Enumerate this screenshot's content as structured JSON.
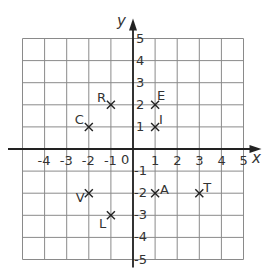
{
  "chart_data": {
    "type": "scatter",
    "title": "",
    "xlabel": "x",
    "ylabel": "y",
    "xlim": [
      -5,
      5
    ],
    "ylim": [
      -5,
      5
    ],
    "grid": true,
    "x_ticks": [
      "-4",
      "-3",
      "-2",
      "-1",
      "0",
      "1",
      "2",
      "3",
      "4",
      "5"
    ],
    "y_ticks": [
      "5",
      "4",
      "3",
      "2",
      "1",
      "-1",
      "-2",
      "-3",
      "-4",
      "-5"
    ],
    "marker": "x",
    "points": [
      {
        "label": "R",
        "x": -1,
        "y": 2
      },
      {
        "label": "E",
        "x": 1,
        "y": 2
      },
      {
        "label": "C",
        "x": -2,
        "y": 1
      },
      {
        "label": "I",
        "x": 1,
        "y": 1
      },
      {
        "label": "V",
        "x": -2,
        "y": -2
      },
      {
        "label": "A",
        "x": 1,
        "y": -2
      },
      {
        "label": "T",
        "x": 3,
        "y": -2
      },
      {
        "label": "L",
        "x": -1,
        "y": -3
      }
    ]
  },
  "colors": {
    "grid": "#8a8a8a",
    "axis": "#222222",
    "text": "#333333",
    "background": "#ffffff"
  }
}
